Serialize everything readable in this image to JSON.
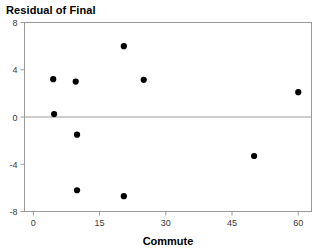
{
  "chart_data": {
    "type": "scatter",
    "title": "Residual of Final",
    "xlabel": "Commute",
    "ylabel": "",
    "xlim": [
      -2,
      63
    ],
    "ylim": [
      -8,
      8
    ],
    "xticks": [
      0,
      15,
      30,
      45,
      60
    ],
    "yticks": [
      8,
      4,
      0,
      -4,
      -8
    ],
    "xtick_labels": [
      "0",
      "15",
      "30",
      "45",
      "60"
    ],
    "ytick_labels": [
      "8",
      "4",
      "0",
      "-4",
      "-8"
    ],
    "grid": false,
    "legend": null,
    "reference_line": {
      "axis": "y",
      "value": 0
    },
    "series": [
      {
        "name": "Residual of Final",
        "marker": "filled-circle",
        "color": "#000000",
        "points": [
          {
            "x": 4.5,
            "y": 3.2
          },
          {
            "x": 4.7,
            "y": 0.25
          },
          {
            "x": 9.6,
            "y": 3.0
          },
          {
            "x": 9.9,
            "y": -1.5
          },
          {
            "x": 9.9,
            "y": -6.2
          },
          {
            "x": 20.5,
            "y": 6.0
          },
          {
            "x": 20.5,
            "y": -6.7
          },
          {
            "x": 25.0,
            "y": 3.15
          },
          {
            "x": 50.0,
            "y": -3.3
          },
          {
            "x": 60.0,
            "y": 2.1
          }
        ]
      }
    ]
  },
  "colors": {
    "point": "#000000",
    "axis": "#9a9a9a",
    "text": "#000000",
    "tick_text": "#3a3a3a",
    "background": "#ffffff"
  }
}
